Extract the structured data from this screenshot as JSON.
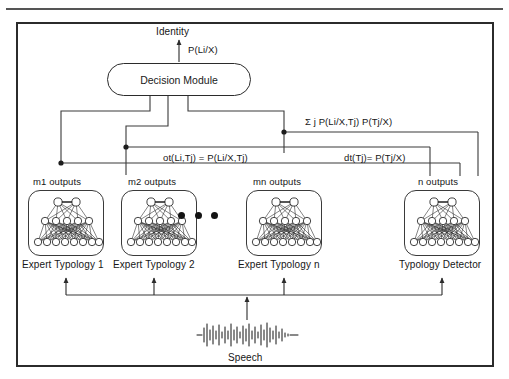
{
  "figure": {
    "type": "system-block-diagram",
    "title_present": false,
    "top_output": {
      "label": "Identity",
      "edge_label": "P(Li/X)"
    },
    "decision_module": {
      "label": "Decision Module"
    },
    "edge_labels": {
      "sum_rule": "Σ j P(Li/X,Tj) P(Tj/X)",
      "expert_output": "ot(Li,Tj) = P(Li/X,Tj)",
      "detector_output": "dt(Tj)= P(Tj/X)"
    },
    "output_counts": [
      "m1 outputs",
      "m2 outputs",
      "mn outputs",
      "n outputs"
    ],
    "modules": [
      {
        "name": "Expert Typology 1",
        "outputs": "m1 outputs",
        "kind": "expert"
      },
      {
        "name": "Expert Typology 2",
        "outputs": "m2 outputs",
        "kind": "expert"
      },
      {
        "name": "Expert Typology n",
        "outputs": "mn outputs",
        "kind": "expert"
      },
      {
        "name": "Typology Detector",
        "outputs": "n outputs",
        "kind": "detector"
      }
    ],
    "ellipsis": "• • •",
    "input": {
      "label": "Speech",
      "icon": "speech-waveform-icon"
    },
    "network_topology": {
      "layers": [
        2,
        5,
        8
      ],
      "description": "3-layer fully connected feed-forward network"
    },
    "colors": {
      "frame": "#2b2b2b",
      "wire": "#3a3a3a",
      "text": "#161616",
      "background": "#ffffff"
    }
  }
}
